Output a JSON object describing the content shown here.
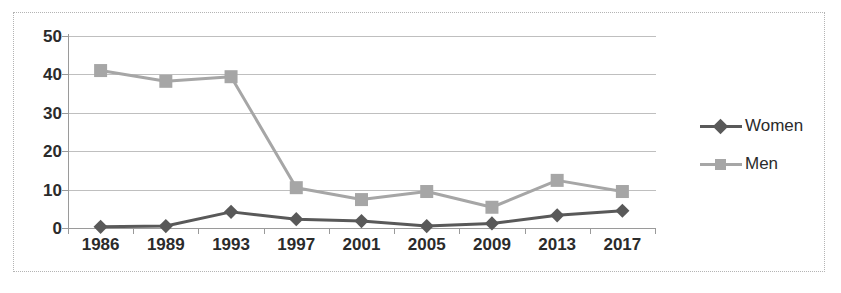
{
  "chart_data": {
    "type": "line",
    "title": "",
    "subtitle": "",
    "xlabel": "",
    "ylabel": "",
    "categories": [
      "1986",
      "1989",
      "1993",
      "1997",
      "2001",
      "2005",
      "2009",
      "2013",
      "2017"
    ],
    "series": [
      {
        "name": "Women",
        "color": "#595959",
        "marker": "diamond",
        "values": [
          0.3,
          0.5,
          4.2,
          2.3,
          1.8,
          0.5,
          1.2,
          3.3,
          4.5
        ]
      },
      {
        "name": "Men",
        "color": "#a6a6a6",
        "marker": "square",
        "values": [
          41.0,
          38.2,
          39.4,
          10.5,
          7.4,
          9.5,
          5.4,
          12.4,
          9.5
        ]
      }
    ],
    "ylim": [
      0,
      50
    ],
    "yticks": [
      0,
      10,
      20,
      30,
      40,
      50
    ],
    "ytick_labels": [
      "0",
      "10",
      "20",
      "30",
      "40",
      "50"
    ],
    "grid": true,
    "grid_axis": "y",
    "legend_position": "right",
    "frame": "dotted-box"
  },
  "legend": {
    "entries": [
      {
        "label": "Women"
      },
      {
        "label": "Men"
      }
    ]
  },
  "colors": {
    "women": "#595959",
    "men": "#a6a6a6",
    "gridline": "#bfbfbf",
    "axis": "#9a9a9a",
    "text": "#2b2b2b",
    "frame": "#b4b4b4",
    "background": "#ffffff"
  }
}
